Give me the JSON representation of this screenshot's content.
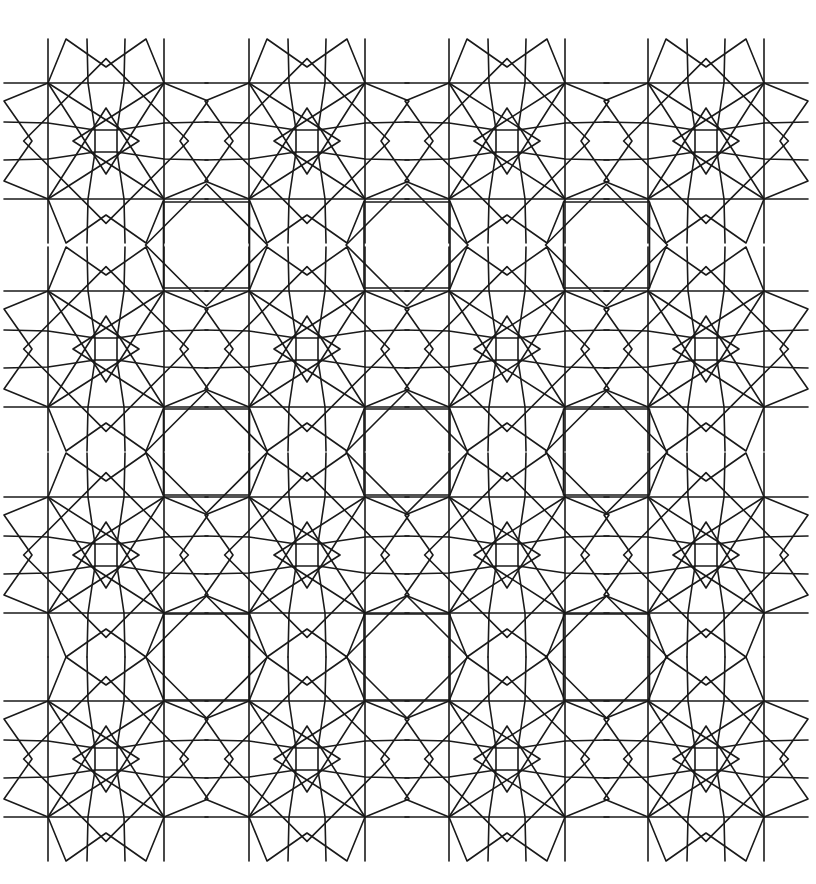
{
  "figure": {
    "background": "#ffffff",
    "stroke": "#1a1a1a",
    "stroke_width": 1.6
  },
  "grid": {
    "columns_x": [
      106,
      307,
      507,
      706
    ],
    "rows_y": [
      141,
      349,
      555,
      759
    ]
  },
  "rosette": {
    "outer_half": 58,
    "inner_half": 11,
    "mid_offset": 19,
    "peak_offset": 103,
    "side_peak_offset": 40,
    "star_point_offset": 33,
    "bow": 3
  },
  "octagon": {
    "half": 43,
    "diamond_half": 61
  }
}
